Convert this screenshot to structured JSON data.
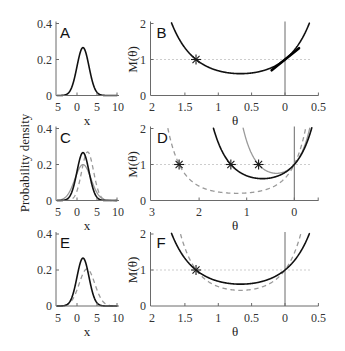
{
  "figure": {
    "ylabel_density": "Probability density"
  },
  "panels": {
    "A": {
      "letter": "A",
      "xlabel": "x",
      "xticks": [
        "5",
        "0",
        "5",
        "10"
      ],
      "yticks": [
        "0",
        "0.2",
        "0.4"
      ]
    },
    "B": {
      "letter": "B",
      "xlabel": "θ",
      "ylabel": "M(θ)",
      "xticks": [
        "2",
        "1.5",
        "1",
        "0.5",
        "0",
        "0.5"
      ],
      "yticks": [
        "0",
        "1",
        "2"
      ]
    },
    "C": {
      "letter": "C",
      "xlabel": "x",
      "xticks": [
        "5",
        "0",
        "5",
        "10"
      ],
      "yticks": [
        "0",
        "0.2",
        "0.4"
      ]
    },
    "D": {
      "letter": "D",
      "xlabel": "θ",
      "ylabel": "M(θ)",
      "xticks": [
        "3",
        "2",
        "1",
        "0"
      ],
      "yticks": [
        "0",
        "1",
        "2"
      ]
    },
    "E": {
      "letter": "E",
      "xlabel": "x",
      "xticks": [
        "5",
        "0",
        "5",
        "10"
      ],
      "yticks": [
        "0",
        "0.2",
        "0.4"
      ]
    },
    "F": {
      "letter": "F",
      "xlabel": "θ",
      "ylabel": "M(θ)",
      "xticks": [
        "2",
        "1.5",
        "1",
        "0.5",
        "0",
        "0.5"
      ],
      "yticks": [
        "0",
        "1",
        "2"
      ]
    }
  },
  "chart_data": [
    {
      "panel": "A",
      "type": "line",
      "title": "",
      "xlabel": "x",
      "ylabel": "Probability density",
      "xlim": [
        -5,
        10
      ],
      "ylim": [
        0,
        0.4
      ],
      "x_ticks": [
        -5,
        0,
        5,
        10
      ],
      "y_ticks": [
        0,
        0.2,
        0.4
      ],
      "grid": false,
      "legend": "none",
      "series": [
        {
          "name": "black solid density",
          "kind": "normal_pdf",
          "mean": 1.5,
          "sd": 1.5,
          "peak": 0.27,
          "color": "#111111",
          "style": "solid"
        }
      ]
    },
    {
      "panel": "B",
      "type": "line",
      "title": "",
      "xlabel": "θ",
      "ylabel": "M(θ)",
      "xlim": [
        2,
        -0.5
      ],
      "x_reversed": true,
      "ylim": [
        0,
        2
      ],
      "x_ticks": [
        2,
        1.5,
        1,
        0.5,
        0,
        -0.5
      ],
      "y_ticks": [
        0,
        1,
        2
      ],
      "grid": false,
      "legend": "none",
      "reference_lines": [
        {
          "type": "hline",
          "y": 1,
          "style": "dotted"
        },
        {
          "type": "vline",
          "x": 0,
          "style": "solid"
        }
      ],
      "series": [
        {
          "name": "black solid M",
          "kind": "mgf",
          "formula": "exp(-a*θ + b*θ^2)",
          "a": 1.5,
          "b": 1.125,
          "root": 1.333,
          "min_theta": 0.667,
          "min_M": 0.61,
          "color": "#111111",
          "style": "solid"
        }
      ],
      "tangent": {
        "theta_from": 0.2,
        "theta_to": -0.21,
        "M_at_0": 1,
        "slope": -1.5
      },
      "markers": [
        {
          "theta": 1.333,
          "M": 1,
          "symbol": "asterisk"
        }
      ]
    },
    {
      "panel": "C",
      "type": "line",
      "title": "",
      "xlabel": "x",
      "ylabel": "Probability density",
      "xlim": [
        -5,
        10
      ],
      "ylim": [
        0,
        0.4
      ],
      "x_ticks": [
        -5,
        0,
        5,
        10
      ],
      "y_ticks": [
        0,
        0.2,
        0.4
      ],
      "grid": false,
      "legend": "none",
      "series": [
        {
          "name": "gray solid density",
          "kind": "normal_pdf",
          "mean": 1.5,
          "sd": 2.0,
          "peak": 0.2,
          "color": "#9a9a9a",
          "style": "gray-solid"
        },
        {
          "name": "gray dashed density",
          "kind": "normal_pdf",
          "mean": 2.66,
          "sd": 1.48,
          "peak": 0.27,
          "color": "#9a9a9a",
          "style": "dashed"
        },
        {
          "name": "black solid density",
          "kind": "normal_pdf",
          "mean": 1.5,
          "sd": 1.5,
          "peak": 0.27,
          "color": "#111111",
          "style": "solid"
        }
      ]
    },
    {
      "panel": "D",
      "type": "line",
      "title": "",
      "xlabel": "θ",
      "ylabel": "M(θ)",
      "xlim": [
        3,
        -0.5
      ],
      "x_reversed": true,
      "ylim": [
        0,
        2
      ],
      "x_ticks": [
        3,
        2,
        1,
        0
      ],
      "y_ticks": [
        0,
        1,
        2
      ],
      "grid": false,
      "legend": "none",
      "reference_lines": [
        {
          "type": "hline",
          "y": 1,
          "style": "dotted"
        },
        {
          "type": "vline",
          "x": 0,
          "style": "solid"
        }
      ],
      "series": [
        {
          "name": "gray dashed M",
          "kind": "mgf",
          "formula": "exp(-a*θ + b*θ^2)",
          "a": 2.66,
          "b": 1.1,
          "root": 2.42,
          "min_theta": 1.21,
          "min_M": 0.2,
          "color": "#9a9a9a",
          "style": "dashed"
        },
        {
          "name": "gray solid M",
          "kind": "mgf",
          "formula": "exp(-a*θ + b*θ^2)",
          "a": 1.5,
          "b": 2.0,
          "root": 0.75,
          "min_theta": 0.375,
          "min_M": 0.76,
          "color": "#9a9a9a",
          "style": "gray-solid"
        },
        {
          "name": "black solid M",
          "kind": "mgf",
          "formula": "exp(-a*θ + b*θ^2)",
          "a": 1.5,
          "b": 1.125,
          "root": 1.333,
          "min_theta": 0.667,
          "min_M": 0.61,
          "color": "#111111",
          "style": "solid"
        }
      ],
      "markers": [
        {
          "theta": 2.42,
          "M": 1,
          "symbol": "asterisk"
        },
        {
          "theta": 1.333,
          "M": 1,
          "symbol": "asterisk"
        },
        {
          "theta": 0.75,
          "M": 1,
          "symbol": "asterisk"
        }
      ]
    },
    {
      "panel": "E",
      "type": "line",
      "title": "",
      "xlabel": "x",
      "ylabel": "Probability density",
      "xlim": [
        -5,
        10
      ],
      "ylim": [
        0,
        0.4
      ],
      "x_ticks": [
        -5,
        0,
        5,
        10
      ],
      "y_ticks": [
        0,
        0.2,
        0.4
      ],
      "grid": false,
      "legend": "none",
      "series": [
        {
          "name": "gray dashed density",
          "kind": "normal_pdf",
          "mean": 2.5,
          "sd": 1.94,
          "peak": 0.21,
          "color": "#9a9a9a",
          "style": "dashed"
        },
        {
          "name": "black solid density",
          "kind": "normal_pdf",
          "mean": 1.5,
          "sd": 1.5,
          "peak": 0.27,
          "color": "#111111",
          "style": "solid"
        }
      ]
    },
    {
      "panel": "F",
      "type": "line",
      "title": "",
      "xlabel": "θ",
      "ylabel": "M(θ)",
      "xlim": [
        2,
        -0.5
      ],
      "x_reversed": true,
      "ylim": [
        0,
        2
      ],
      "x_ticks": [
        2,
        1.5,
        1,
        0.5,
        0,
        -0.5
      ],
      "y_ticks": [
        0,
        1,
        2
      ],
      "grid": false,
      "legend": "none",
      "reference_lines": [
        {
          "type": "hline",
          "y": 1,
          "style": "dotted"
        },
        {
          "type": "vline",
          "x": 0,
          "style": "solid"
        }
      ],
      "series": [
        {
          "name": "gray dashed M",
          "kind": "mgf",
          "formula": "exp(-a*θ + b*θ^2)",
          "a": 2.5,
          "b": 1.88,
          "root": 1.333,
          "min_theta": 0.665,
          "min_M": 0.44,
          "color": "#9a9a9a",
          "style": "dashed"
        },
        {
          "name": "black solid M",
          "kind": "mgf",
          "formula": "exp(-a*θ + b*θ^2)",
          "a": 1.5,
          "b": 1.125,
          "root": 1.333,
          "min_theta": 0.667,
          "min_M": 0.61,
          "color": "#111111",
          "style": "solid"
        }
      ],
      "markers": [
        {
          "theta": 1.333,
          "M": 1,
          "symbol": "asterisk"
        }
      ]
    }
  ]
}
